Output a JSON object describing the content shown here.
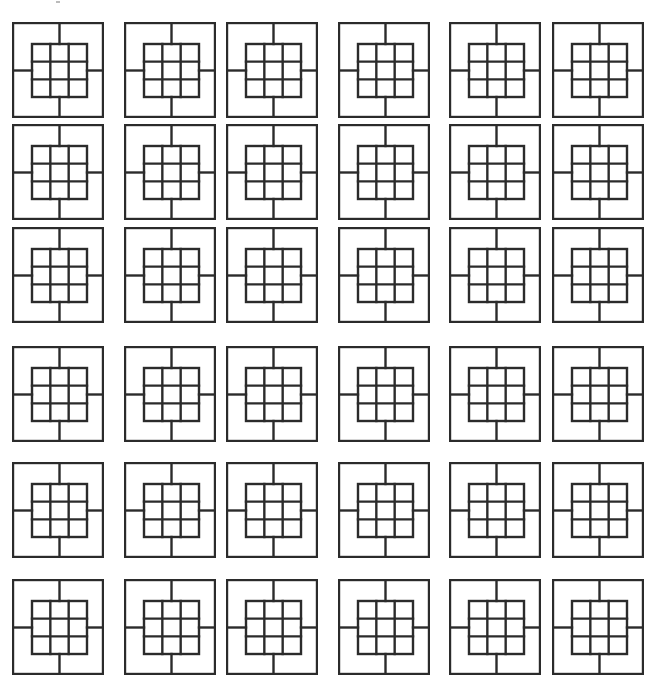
{
  "figure": {
    "rows": 6,
    "cols": 6,
    "stroke_color": "#2b2b2b",
    "background": "#ffffff",
    "column_x": [
      13,
      125,
      227,
      339,
      450,
      553
    ],
    "row_y": [
      23,
      125,
      228,
      347,
      463,
      580
    ],
    "tile": {
      "outer_width": 90,
      "outer_height": 94,
      "inner_grid": {
        "cells_x": 3,
        "cells_y": 3,
        "offset_x": 19,
        "offset_y": 21,
        "width": 55,
        "height": 53
      },
      "spokes": [
        "top",
        "right",
        "bottom",
        "left"
      ]
    }
  }
}
